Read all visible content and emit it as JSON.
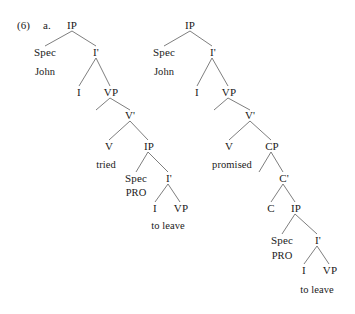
{
  "figure": {
    "example_number": "(6)",
    "sub_label": "a.",
    "background_color": "#ffffff",
    "line_color": "#6f6f6f",
    "text_color": "#1a1a1a"
  },
  "tree_left": {
    "nodes": {
      "ip": "IP",
      "spec": "Spec",
      "ibar": "I'",
      "john": "John",
      "i": "I",
      "vp": "VP",
      "vbar": "V'",
      "v": "V",
      "tried": "tried",
      "ip2": "IP",
      "spec2": "Spec",
      "ibar2": "I'",
      "pro": "PRO",
      "i2": "I",
      "vp2": "VP",
      "to_leave": "to leave"
    }
  },
  "tree_right": {
    "nodes": {
      "ip": "IP",
      "spec": "Spec",
      "ibar": "I'",
      "john": "John",
      "i": "I",
      "vp": "VP",
      "vbar": "V'",
      "v": "V",
      "promised": "promised",
      "cp": "CP",
      "cbar": "C'",
      "c": "C",
      "ip2": "IP",
      "spec2": "Spec",
      "ibar2": "I'",
      "pro": "PRO",
      "i2": "I",
      "vp2": "VP",
      "to_leave": "to leave"
    }
  }
}
